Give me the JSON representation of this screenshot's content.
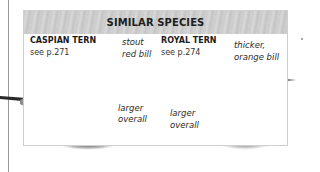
{
  "panel": {
    "title": "SIMILAR SPECIES",
    "species": [
      {
        "name": "CASPIAN TERN",
        "reference": "see p.271",
        "annotations": [
          {
            "line1": "stout",
            "line2": "red bill"
          },
          {
            "line1": "larger",
            "line2": "overall"
          }
        ]
      },
      {
        "name": "ROYAL TERN",
        "reference": "see p.274",
        "annotations": [
          {
            "line1": "thicker,",
            "line2": "orange bill"
          },
          {
            "line1": "larger",
            "line2": "overall"
          }
        ]
      }
    ]
  },
  "colors": {
    "header_band": "#cccccc",
    "panel_border": "#cfcfcf",
    "page_rule": "#9a9a9a",
    "text": "#1e1e1e"
  }
}
